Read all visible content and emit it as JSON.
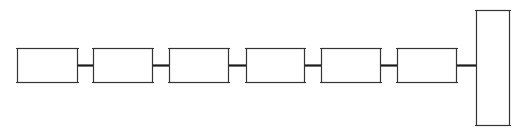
{
  "diagram": {
    "stroke_color": "#333333",
    "connector_color": "#1a1a1a",
    "background": "#ffffff",
    "boxes": [
      {
        "id": "box-1",
        "x": 17,
        "y": 48,
        "w": 60,
        "h": 34
      },
      {
        "id": "box-2",
        "x": 93,
        "y": 48,
        "w": 59,
        "h": 34
      },
      {
        "id": "box-3",
        "x": 169,
        "y": 48,
        "w": 59,
        "h": 34
      },
      {
        "id": "box-4",
        "x": 246,
        "y": 48,
        "w": 58,
        "h": 34
      },
      {
        "id": "box-5",
        "x": 321,
        "y": 48,
        "w": 59,
        "h": 34
      },
      {
        "id": "box-6",
        "x": 397,
        "y": 48,
        "w": 59,
        "h": 34
      },
      {
        "id": "tall-box",
        "x": 476,
        "y": 10,
        "w": 33,
        "h": 115
      }
    ],
    "connectors": [
      {
        "x1": 77,
        "x2": 93,
        "y": 65
      },
      {
        "x1": 152,
        "x2": 169,
        "y": 65
      },
      {
        "x1": 228,
        "x2": 246,
        "y": 65
      },
      {
        "x1": 304,
        "x2": 321,
        "y": 65
      },
      {
        "x1": 380,
        "x2": 397,
        "y": 65
      },
      {
        "x1": 456,
        "x2": 476,
        "y": 65
      }
    ]
  }
}
